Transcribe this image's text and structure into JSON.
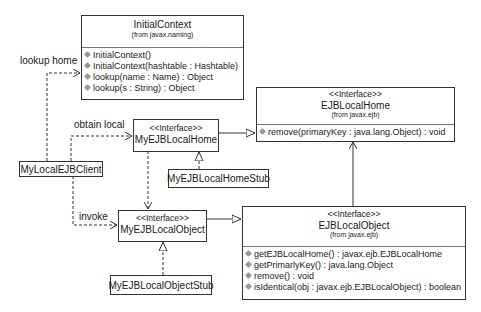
{
  "diagram": {
    "classes": {
      "initial_context": {
        "name": "InitialContext",
        "from": "(from javax.naming)",
        "operations": [
          "InitialContext()",
          "InitialContext(hashtable : Hashtable)",
          "lookup(name : Name) : Object",
          "lookup(s : String) : Object"
        ]
      },
      "ejb_local_home": {
        "stereotype": "<<Interface>>",
        "name": "EJBLocalHome",
        "from": "(from javax.ejb)",
        "operations": [
          "remove(primaryKey : java.lang.Object) : void"
        ]
      },
      "my_ejb_local_home": {
        "stereotype": "<<Interface>>",
        "name": "MyEJBLocalHome"
      },
      "my_ejb_local_home_stub": {
        "name": "MyEJBLocalHomeStub"
      },
      "my_local_ejb_client": {
        "name": "MyLocalEJBClient"
      },
      "my_ejb_local_object": {
        "stereotype": "<<Interface>>",
        "name": "MyEJBLocalObject"
      },
      "my_ejb_local_object_stub": {
        "name": "MyEJBLocalObjectStub"
      },
      "ejb_local_object": {
        "stereotype": "<<Interface>>",
        "name": "EJBLocalObject",
        "from": "(from javax.ejb)",
        "operations": [
          "getEJBLocalHome() : javax.ejb.EJBLocalHome",
          "getPrimarlyKey() : java.lang.Object",
          "remove() : void",
          "isIdentical(obj : javax.ejb.EJBLocalObject) : boolean"
        ]
      }
    },
    "relations": {
      "lookup_home": "lookup home",
      "obtain_local": "obtain local",
      "invoke": "invoke"
    },
    "colors": {
      "line": "#333333",
      "operation_icon": "#999999",
      "separator": "#777777"
    }
  }
}
